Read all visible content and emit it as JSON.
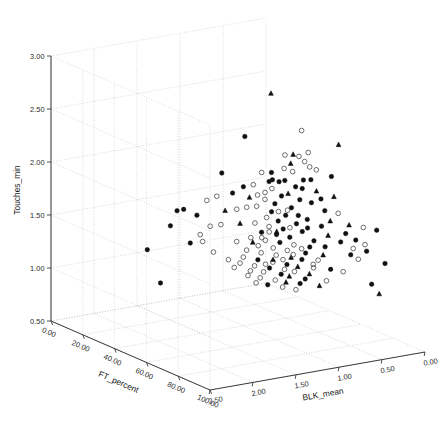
{
  "chart_data": {
    "type": "scatter",
    "title": "",
    "projection": "3d",
    "xlabel": "FT_percent",
    "ylabel": "Touches_min",
    "zlabel": "BLK_mean",
    "axes": {
      "ft_percent": {
        "label": "FT_percent",
        "ticks": [
          "0.00",
          "20.00",
          "40.00",
          "60.00",
          "80.00",
          "100.00"
        ],
        "values": [
          0,
          20,
          40,
          60,
          80,
          100
        ],
        "range": [
          0,
          100
        ],
        "direction": "increasing-toward-viewer"
      },
      "touches_min": {
        "label": "Touches_min",
        "ticks": [
          "0.50",
          "1.00",
          "1.50",
          "2.00",
          "2.50",
          "3.00"
        ],
        "values": [
          0.5,
          1.0,
          1.5,
          2.0,
          2.5,
          3.0
        ],
        "range": [
          0.5,
          3.0
        ],
        "direction": "increasing-upward"
      },
      "blk_mean": {
        "label": "BLK_mean",
        "ticks": [
          "2.50",
          "2.00",
          "1.50",
          "1.00",
          "0.50",
          "0.00"
        ],
        "values": [
          2.5,
          2.0,
          1.5,
          1.0,
          0.5,
          0.0
        ],
        "range": [
          0,
          2.5
        ],
        "direction": "decreasing-to-the-right"
      }
    },
    "grid": true,
    "legend": null,
    "marker_styles": [
      {
        "name": "filled-circle",
        "color": "#111111",
        "fill": "#111111"
      },
      {
        "name": "open-circle",
        "color": "#555555",
        "fill": "none"
      },
      {
        "name": "filled-triangle",
        "color": "#111111",
        "fill": "#111111"
      }
    ],
    "points": [
      {
        "ft": 61.0,
        "tm": 2.84,
        "blk": 1.07,
        "m": "t"
      },
      {
        "ft": 57.0,
        "tm": 2.44,
        "blk": 1.3,
        "m": "f"
      },
      {
        "ft": 70.0,
        "tm": 2.52,
        "blk": 0.88,
        "m": "o"
      },
      {
        "ft": 77.0,
        "tm": 2.39,
        "blk": 0.58,
        "m": "t"
      },
      {
        "ft": 72.0,
        "tm": 2.32,
        "blk": 0.84,
        "m": "o"
      },
      {
        "ft": 66.0,
        "tm": 2.28,
        "blk": 1.0,
        "m": "o"
      },
      {
        "ft": 69.0,
        "tm": 2.3,
        "blk": 0.96,
        "m": "t"
      },
      {
        "ft": 71.0,
        "tm": 2.29,
        "blk": 0.93,
        "m": "o"
      },
      {
        "ft": 73.0,
        "tm": 2.25,
        "blk": 0.9,
        "m": "o"
      },
      {
        "ft": 68.0,
        "tm": 2.21,
        "blk": 0.97,
        "m": "t"
      },
      {
        "ft": 74.0,
        "tm": 2.2,
        "blk": 0.86,
        "m": "o"
      },
      {
        "ft": 76.0,
        "tm": 2.18,
        "blk": 0.82,
        "m": "o"
      },
      {
        "ft": 64.0,
        "tm": 2.12,
        "blk": 1.12,
        "m": "f"
      },
      {
        "ft": 49.0,
        "tm": 2.06,
        "blk": 1.42,
        "m": "f"
      },
      {
        "ft": 79.0,
        "tm": 2.12,
        "blk": 0.7,
        "m": "f"
      },
      {
        "ft": 60.0,
        "tm": 2.1,
        "blk": 1.16,
        "m": "o"
      },
      {
        "ft": 67.0,
        "tm": 2.05,
        "blk": 1.02,
        "m": "f"
      },
      {
        "ft": 65.0,
        "tm": 2.03,
        "blk": 1.05,
        "m": "f"
      },
      {
        "ft": 63.0,
        "tm": 2.04,
        "blk": 1.09,
        "m": "f"
      },
      {
        "ft": 62.0,
        "tm": 2.02,
        "blk": 1.11,
        "m": "f"
      },
      {
        "ft": 70.0,
        "tm": 2.0,
        "blk": 0.95,
        "m": "f"
      },
      {
        "ft": 72.0,
        "tm": 1.99,
        "blk": 0.91,
        "m": "f"
      },
      {
        "ft": 75.0,
        "tm": 1.97,
        "blk": 0.8,
        "m": "t"
      },
      {
        "ft": 58.0,
        "tm": 1.98,
        "blk": 1.22,
        "m": "o"
      },
      {
        "ft": 55.0,
        "tm": 1.95,
        "blk": 1.28,
        "m": "f"
      },
      {
        "ft": 68.0,
        "tm": 1.93,
        "blk": 1.0,
        "m": "t"
      },
      {
        "ft": 66.0,
        "tm": 1.9,
        "blk": 1.04,
        "m": "f"
      },
      {
        "ft": 71.0,
        "tm": 1.88,
        "blk": 0.92,
        "m": "f"
      },
      {
        "ft": 74.0,
        "tm": 1.86,
        "blk": 0.84,
        "m": "f"
      },
      {
        "ft": 52.0,
        "tm": 1.88,
        "blk": 1.35,
        "m": "f"
      },
      {
        "ft": 48.0,
        "tm": 1.84,
        "blk": 1.46,
        "m": "o"
      },
      {
        "ft": 61.0,
        "tm": 1.85,
        "blk": 1.14,
        "m": "o"
      },
      {
        "ft": 64.0,
        "tm": 1.82,
        "blk": 1.08,
        "m": "f"
      },
      {
        "ft": 69.0,
        "tm": 1.8,
        "blk": 0.98,
        "m": "f"
      },
      {
        "ft": 77.0,
        "tm": 1.79,
        "blk": 0.74,
        "m": "f"
      },
      {
        "ft": 80.0,
        "tm": 1.77,
        "blk": 0.64,
        "m": "o"
      },
      {
        "ft": 59.0,
        "tm": 1.78,
        "blk": 1.2,
        "m": "o"
      },
      {
        "ft": 56.0,
        "tm": 1.76,
        "blk": 1.26,
        "m": "o"
      },
      {
        "ft": 45.0,
        "tm": 1.79,
        "blk": 1.52,
        "m": "o"
      },
      {
        "ft": 63.0,
        "tm": 1.74,
        "blk": 1.1,
        "m": "f"
      },
      {
        "ft": 67.0,
        "tm": 1.72,
        "blk": 1.01,
        "m": "f"
      },
      {
        "ft": 73.0,
        "tm": 1.7,
        "blk": 0.87,
        "m": "f"
      },
      {
        "ft": 53.0,
        "tm": 1.73,
        "blk": 1.32,
        "m": "o"
      },
      {
        "ft": 50.0,
        "tm": 1.71,
        "blk": 1.4,
        "m": "t"
      },
      {
        "ft": 61.5,
        "tm": 1.68,
        "blk": 1.13,
        "m": "o"
      },
      {
        "ft": 65.0,
        "tm": 1.66,
        "blk": 1.06,
        "m": "f"
      },
      {
        "ft": 70.0,
        "tm": 1.65,
        "blk": 0.94,
        "m": "f"
      },
      {
        "ft": 76.0,
        "tm": 1.64,
        "blk": 0.76,
        "m": "f"
      },
      {
        "ft": 82.0,
        "tm": 1.66,
        "blk": 0.55,
        "m": "t"
      },
      {
        "ft": 85.0,
        "tm": 1.64,
        "blk": 0.44,
        "m": "o"
      },
      {
        "ft": 88.0,
        "tm": 1.62,
        "blk": 0.34,
        "m": "f"
      },
      {
        "ft": 38.0,
        "tm": 1.68,
        "blk": 1.66,
        "m": "f"
      },
      {
        "ft": 36.0,
        "tm": 1.66,
        "blk": 1.7,
        "m": "f"
      },
      {
        "ft": 42.0,
        "tm": 1.64,
        "blk": 1.58,
        "m": "f"
      },
      {
        "ft": 58.5,
        "tm": 1.62,
        "blk": 1.21,
        "m": "o"
      },
      {
        "ft": 62.5,
        "tm": 1.6,
        "blk": 1.12,
        "m": "o"
      },
      {
        "ft": 66.5,
        "tm": 1.59,
        "blk": 1.03,
        "m": "f"
      },
      {
        "ft": 71.5,
        "tm": 1.58,
        "blk": 0.9,
        "m": "f"
      },
      {
        "ft": 54.0,
        "tm": 1.6,
        "blk": 1.3,
        "m": "t"
      },
      {
        "ft": 49.5,
        "tm": 1.58,
        "blk": 1.44,
        "m": "o"
      },
      {
        "ft": 78.0,
        "tm": 1.56,
        "blk": 0.72,
        "m": "t"
      },
      {
        "ft": 60.5,
        "tm": 1.54,
        "blk": 1.17,
        "m": "f"
      },
      {
        "ft": 64.5,
        "tm": 1.53,
        "blk": 1.07,
        "m": "f"
      },
      {
        "ft": 68.5,
        "tm": 1.52,
        "blk": 0.99,
        "m": "f"
      },
      {
        "ft": 74.5,
        "tm": 1.5,
        "blk": 0.82,
        "m": "f"
      },
      {
        "ft": 80.5,
        "tm": 1.5,
        "blk": 0.62,
        "m": "f"
      },
      {
        "ft": 34.0,
        "tm": 1.51,
        "blk": 1.74,
        "m": "f"
      },
      {
        "ft": 57.5,
        "tm": 1.48,
        "blk": 1.24,
        "m": "o"
      },
      {
        "ft": 61.8,
        "tm": 1.47,
        "blk": 1.15,
        "m": "o"
      },
      {
        "ft": 65.5,
        "tm": 1.46,
        "blk": 1.05,
        "m": "f"
      },
      {
        "ft": 69.5,
        "tm": 1.45,
        "blk": 0.96,
        "m": "o"
      },
      {
        "ft": 73.5,
        "tm": 1.44,
        "blk": 0.85,
        "m": "f"
      },
      {
        "ft": 83.0,
        "tm": 1.44,
        "blk": 0.52,
        "m": "o"
      },
      {
        "ft": 86.0,
        "tm": 1.42,
        "blk": 0.42,
        "m": "f"
      },
      {
        "ft": 53.5,
        "tm": 1.43,
        "blk": 1.33,
        "m": "o"
      },
      {
        "ft": 59.5,
        "tm": 1.41,
        "blk": 1.19,
        "m": "o"
      },
      {
        "ft": 63.5,
        "tm": 1.4,
        "blk": 1.09,
        "m": "o"
      },
      {
        "ft": 67.5,
        "tm": 1.39,
        "blk": 1.0,
        "m": "o"
      },
      {
        "ft": 72.5,
        "tm": 1.38,
        "blk": 0.88,
        "m": "f"
      },
      {
        "ft": 76.5,
        "tm": 1.37,
        "blk": 0.75,
        "m": "t"
      },
      {
        "ft": 44.0,
        "tm": 1.4,
        "blk": 1.55,
        "m": "o"
      },
      {
        "ft": 40.0,
        "tm": 1.37,
        "blk": 1.62,
        "m": "f"
      },
      {
        "ft": 56.5,
        "tm": 1.36,
        "blk": 1.27,
        "m": "o"
      },
      {
        "ft": 60.8,
        "tm": 1.35,
        "blk": 1.18,
        "m": "o"
      },
      {
        "ft": 64.8,
        "tm": 1.34,
        "blk": 1.08,
        "m": "o"
      },
      {
        "ft": 68.8,
        "tm": 1.33,
        "blk": 0.98,
        "m": "t"
      },
      {
        "ft": 71.8,
        "tm": 1.32,
        "blk": 0.91,
        "m": "f"
      },
      {
        "ft": 75.5,
        "tm": 1.32,
        "blk": 0.79,
        "m": "o"
      },
      {
        "ft": 84.0,
        "tm": 1.34,
        "blk": 0.48,
        "m": "o"
      },
      {
        "ft": 90.0,
        "tm": 1.31,
        "blk": 0.28,
        "m": "f"
      },
      {
        "ft": 47.0,
        "tm": 1.31,
        "blk": 1.48,
        "m": "o"
      },
      {
        "ft": 55.5,
        "tm": 1.29,
        "blk": 1.29,
        "m": "o"
      },
      {
        "ft": 59.8,
        "tm": 1.28,
        "blk": 1.2,
        "m": "f"
      },
      {
        "ft": 63.8,
        "tm": 1.27,
        "blk": 1.1,
        "m": "o"
      },
      {
        "ft": 67.8,
        "tm": 1.26,
        "blk": 1.01,
        "m": "f"
      },
      {
        "ft": 70.8,
        "tm": 1.25,
        "blk": 0.94,
        "m": "t"
      },
      {
        "ft": 74.8,
        "tm": 1.25,
        "blk": 0.83,
        "m": "o"
      },
      {
        "ft": 78.5,
        "tm": 1.24,
        "blk": 0.7,
        "m": "f"
      },
      {
        "ft": 27.0,
        "tm": 1.26,
        "blk": 1.88,
        "m": "f"
      },
      {
        "ft": 51.0,
        "tm": 1.25,
        "blk": 1.38,
        "m": "o"
      },
      {
        "ft": 54.5,
        "tm": 1.23,
        "blk": 1.31,
        "m": "o"
      },
      {
        "ft": 58.8,
        "tm": 1.22,
        "blk": 1.22,
        "m": "o"
      },
      {
        "ft": 62.8,
        "tm": 1.21,
        "blk": 1.12,
        "m": "f"
      },
      {
        "ft": 66.8,
        "tm": 1.21,
        "blk": 1.02,
        "m": "o"
      },
      {
        "ft": 69.8,
        "tm": 1.2,
        "blk": 0.96,
        "m": "o"
      },
      {
        "ft": 73.8,
        "tm": 1.19,
        "blk": 0.86,
        "m": "t"
      },
      {
        "ft": 81.0,
        "tm": 1.22,
        "blk": 0.6,
        "m": "o"
      },
      {
        "ft": 52.5,
        "tm": 1.18,
        "blk": 1.34,
        "m": "o"
      },
      {
        "ft": 57.8,
        "tm": 1.17,
        "blk": 1.25,
        "m": "o"
      },
      {
        "ft": 61.2,
        "tm": 1.17,
        "blk": 1.16,
        "m": "o"
      },
      {
        "ft": 65.8,
        "tm": 1.16,
        "blk": 1.04,
        "m": "f"
      },
      {
        "ft": 68.2,
        "tm": 1.15,
        "blk": 0.99,
        "m": "t"
      },
      {
        "ft": 72.8,
        "tm": 1.14,
        "blk": 0.89,
        "m": "f"
      },
      {
        "ft": 77.5,
        "tm": 1.13,
        "blk": 0.73,
        "m": "o"
      },
      {
        "ft": 87.0,
        "tm": 1.11,
        "blk": 0.38,
        "m": "f"
      },
      {
        "ft": 56.8,
        "tm": 1.12,
        "blk": 1.26,
        "m": "o"
      },
      {
        "ft": 60.2,
        "tm": 1.11,
        "blk": 1.18,
        "m": "o"
      },
      {
        "ft": 64.2,
        "tm": 1.1,
        "blk": 1.08,
        "m": "o"
      },
      {
        "ft": 67.2,
        "tm": 1.09,
        "blk": 1.01,
        "m": "t"
      },
      {
        "ft": 71.2,
        "tm": 1.09,
        "blk": 0.92,
        "m": "f"
      },
      {
        "ft": 75.8,
        "tm": 1.08,
        "blk": 0.78,
        "m": "t"
      },
      {
        "ft": 88.5,
        "tm": 1.02,
        "blk": 0.32,
        "m": "t"
      },
      {
        "ft": 31.0,
        "tm": 0.96,
        "blk": 1.8,
        "m": "f"
      },
      {
        "ft": 66.2,
        "tm": 1.04,
        "blk": 1.03,
        "m": "o"
      },
      {
        "ft": 70.2,
        "tm": 1.03,
        "blk": 0.95,
        "m": "o"
      },
      {
        "ft": 59.2,
        "tm": 1.06,
        "blk": 1.21,
        "m": "o"
      },
      {
        "ft": 62.2,
        "tm": 1.05,
        "blk": 1.13,
        "m": "f"
      },
      {
        "ft": 46.0,
        "tm": 1.55,
        "blk": 1.5,
        "m": "o"
      },
      {
        "ft": 43.0,
        "tm": 1.46,
        "blk": 1.56,
        "m": "o"
      },
      {
        "ft": 79.5,
        "tm": 1.93,
        "blk": 0.68,
        "m": "t"
      },
      {
        "ft": 78.8,
        "tm": 1.7,
        "blk": 0.71,
        "m": "t"
      },
      {
        "ft": 81.5,
        "tm": 1.58,
        "blk": 0.58,
        "m": "f"
      },
      {
        "ft": 83.5,
        "tm": 1.52,
        "blk": 0.5,
        "m": "f"
      },
      {
        "ft": 85.5,
        "tm": 1.48,
        "blk": 0.43,
        "m": "o"
      },
      {
        "ft": 69.2,
        "tm": 2.14,
        "blk": 0.97,
        "m": "o"
      },
      {
        "ft": 66.6,
        "tm": 2.16,
        "blk": 1.02,
        "m": "o"
      },
      {
        "ft": 74.2,
        "tm": 2.08,
        "blk": 0.85,
        "m": "f"
      },
      {
        "ft": 72.2,
        "tm": 2.07,
        "blk": 0.9,
        "m": "f"
      },
      {
        "ft": 63.2,
        "tm": 1.96,
        "blk": 1.1,
        "m": "o"
      },
      {
        "ft": 61.6,
        "tm": 1.92,
        "blk": 1.15,
        "m": "o"
      },
      {
        "ft": 59.6,
        "tm": 1.89,
        "blk": 1.2,
        "m": "o"
      },
      {
        "ft": 57.2,
        "tm": 1.86,
        "blk": 1.25,
        "m": "t"
      },
      {
        "ft": 76.2,
        "tm": 1.9,
        "blk": 0.77,
        "m": "f"
      },
      {
        "ft": 67.6,
        "tm": 1.77,
        "blk": 1.0,
        "m": "o"
      },
      {
        "ft": 65.2,
        "tm": 1.75,
        "blk": 1.06,
        "m": "o"
      },
      {
        "ft": 70.6,
        "tm": 1.73,
        "blk": 0.93,
        "m": "f"
      },
      {
        "ft": 73.2,
        "tm": 1.62,
        "blk": 0.87,
        "m": "f"
      },
      {
        "ft": 68.6,
        "tm": 1.61,
        "blk": 0.99,
        "m": "o"
      },
      {
        "ft": 64.6,
        "tm": 1.56,
        "blk": 1.07,
        "m": "t"
      },
      {
        "ft": 62.6,
        "tm": 1.55,
        "blk": 1.12,
        "m": "o"
      },
      {
        "ft": 60.6,
        "tm": 1.49,
        "blk": 1.17,
        "m": "o"
      },
      {
        "ft": 58.2,
        "tm": 1.44,
        "blk": 1.23,
        "m": "t"
      },
      {
        "ft": 71.6,
        "tm": 1.42,
        "blk": 0.91,
        "m": "o"
      },
      {
        "ft": 69.6,
        "tm": 1.36,
        "blk": 0.97,
        "m": "o"
      },
      {
        "ft": 66.4,
        "tm": 1.3,
        "blk": 1.03,
        "m": "o"
      },
      {
        "ft": 63.4,
        "tm": 1.29,
        "blk": 1.09,
        "m": "t"
      },
      {
        "ft": 61.4,
        "tm": 1.24,
        "blk": 1.14,
        "m": "o"
      },
      {
        "ft": 74.6,
        "tm": 1.28,
        "blk": 0.83,
        "m": "o"
      },
      {
        "ft": 77.2,
        "tm": 1.45,
        "blk": 0.74,
        "m": "f"
      },
      {
        "ft": 82.5,
        "tm": 1.38,
        "blk": 0.54,
        "m": "f"
      }
    ]
  }
}
